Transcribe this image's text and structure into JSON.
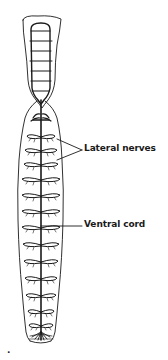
{
  "diagram": {
    "labels": {
      "lateral_nerves": "Lateral nerves",
      "ventral_cord": "Ventral cord"
    },
    "figure_mark": ".",
    "colors": {
      "ink": "#1a1a1a",
      "background": "#ffffff"
    },
    "nerve_pairs_y": [
      123,
      137,
      151,
      165,
      180,
      196,
      212,
      228,
      245,
      262,
      279,
      296,
      312,
      327
    ],
    "pharynx_rings_y": [
      27,
      38,
      50,
      61,
      72,
      83,
      94
    ]
  }
}
